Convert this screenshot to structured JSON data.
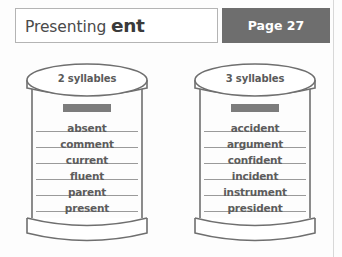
{
  "header": {
    "title_prefix": "Presenting ",
    "title_bold": "ent",
    "page_label": "Page 27"
  },
  "jars": [
    {
      "lid_label": "2 syllables",
      "redacted_heading": "",
      "words": [
        "absent",
        "comment",
        "current",
        "fluent",
        "parent",
        "present"
      ]
    },
    {
      "lid_label": "3 syllables",
      "redacted_heading": "",
      "words": [
        "accident",
        "argument",
        "confident",
        "incident",
        "instrument",
        "president"
      ]
    }
  ],
  "colors": {
    "page_box_background": "#6e6e6e",
    "page_box_text": "#ffffff",
    "title_border": "#b4b4b4",
    "jar_outline": "#6f6f6f",
    "word_text": "#5c5c5c",
    "rule_line": "#9a9a9a",
    "redact_bar": "#7c7c7c",
    "background": "#fdfdfd"
  }
}
